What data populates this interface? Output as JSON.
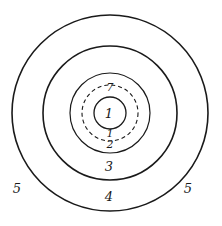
{
  "diagram": {
    "type": "concentric-circles",
    "center": {
      "x": 110,
      "y": 113
    },
    "stroke_color": "#1a1a1a",
    "background": "#ffffff",
    "circles": [
      {
        "id": "ring-5-outer",
        "r": 98,
        "style": "solid",
        "width": 1.6
      },
      {
        "id": "ring-4",
        "r": 67,
        "style": "solid",
        "width": 1.6
      },
      {
        "id": "ring-3",
        "r": 40,
        "style": "solid",
        "width": 1.2
      },
      {
        "id": "ring-dashed",
        "r": 28,
        "style": "dashed",
        "width": 1.1
      },
      {
        "id": "ring-1-inner",
        "r": 16,
        "style": "solid",
        "width": 1.3
      }
    ],
    "labels": [
      {
        "id": "label-center-1",
        "text": "1",
        "x": 109,
        "y": 118,
        "size": "normal"
      },
      {
        "id": "label-top-7",
        "text": "7",
        "x": 110,
        "y": 91,
        "size": "small"
      },
      {
        "id": "label-bottom-1",
        "text": "1",
        "x": 110,
        "y": 137,
        "size": "small"
      },
      {
        "id": "label-bottom-2",
        "text": "2",
        "x": 110,
        "y": 148,
        "size": "small"
      },
      {
        "id": "label-3",
        "text": "3",
        "x": 109,
        "y": 171,
        "size": "normal"
      },
      {
        "id": "label-4",
        "text": "4",
        "x": 109,
        "y": 201,
        "size": "normal"
      },
      {
        "id": "label-5-left",
        "text": "5",
        "x": 17,
        "y": 193,
        "size": "normal"
      },
      {
        "id": "label-5-right",
        "text": "5",
        "x": 188,
        "y": 193,
        "size": "normal"
      }
    ]
  }
}
